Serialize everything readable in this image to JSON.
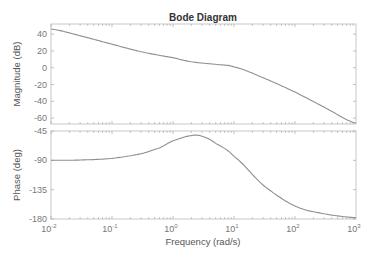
{
  "title": "Bode Diagram",
  "colors": {
    "curve": "#8a8f98",
    "frame": "#c8c8c8",
    "text": "#555555",
    "title": "#333333",
    "background": "#ffffff"
  },
  "xaxis": {
    "label": "Frequency  (rad/s)",
    "scale": "log",
    "range": [
      0.01,
      1000
    ],
    "ticks": [
      {
        "base": "10",
        "exp": "-2"
      },
      {
        "base": "10",
        "exp": "-1"
      },
      {
        "base": "10",
        "exp": "0"
      },
      {
        "base": "10",
        "exp": "1"
      },
      {
        "base": "10",
        "exp": "2"
      },
      {
        "base": "10",
        "exp": "3"
      }
    ]
  },
  "magnitude_axis": {
    "label": "Magnitude (dB)",
    "ticks": [
      "40",
      "20",
      "0",
      "-20",
      "-40",
      "-60"
    ]
  },
  "phase_axis": {
    "label": "Phase (deg)",
    "ticks": [
      "-45",
      "-90",
      "-135",
      "-180"
    ]
  },
  "chart_data": [
    {
      "type": "line",
      "title": "Bode Diagram",
      "subplot": "magnitude",
      "xlabel": "Frequency  (rad/s)",
      "ylabel": "Magnitude (dB)",
      "xscale": "log",
      "xlim": [
        0.01,
        1000
      ],
      "ylim": [
        -67,
        52
      ],
      "yticks": [
        40,
        20,
        0,
        -20,
        -40,
        -60
      ],
      "grid": false,
      "series": [
        {
          "name": "Magnitude",
          "x": [
            0.01,
            0.03,
            0.1,
            0.3,
            1,
            2,
            5,
            10,
            30,
            100,
            300,
            1000
          ],
          "y": [
            46,
            38,
            28,
            19,
            12,
            7,
            4,
            1,
            -12,
            -29,
            -47,
            -66
          ]
        }
      ]
    },
    {
      "type": "line",
      "subplot": "phase",
      "xlabel": "Frequency  (rad/s)",
      "ylabel": "Phase (deg)",
      "xscale": "log",
      "xlim": [
        0.01,
        1000
      ],
      "ylim": [
        -180,
        -45
      ],
      "yticks": [
        -45,
        -90,
        -135,
        -180
      ],
      "grid": false,
      "series": [
        {
          "name": "Phase",
          "x": [
            0.01,
            0.03,
            0.1,
            0.3,
            0.6,
            1,
            2,
            3,
            5,
            10,
            30,
            100,
            300,
            1000
          ],
          "y": [
            -90,
            -89.5,
            -87,
            -80,
            -71,
            -60,
            -52,
            -53,
            -64,
            -84,
            -128,
            -160,
            -172,
            -178
          ]
        }
      ]
    }
  ]
}
